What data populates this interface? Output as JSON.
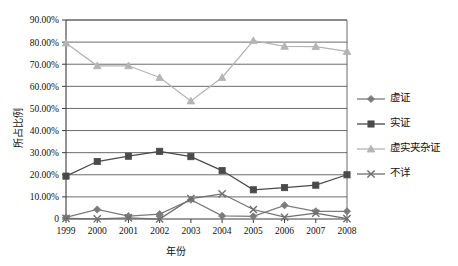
{
  "chart_data": {
    "type": "line",
    "title": "",
    "xlabel": "年份",
    "ylabel": "所占比例",
    "categories": [
      "1999",
      "2000",
      "2001",
      "2002",
      "2003",
      "2004",
      "2005",
      "2006",
      "2007",
      "2008"
    ],
    "x": [
      1999,
      2000,
      2001,
      2002,
      2003,
      2004,
      2005,
      2006,
      2007,
      2008
    ],
    "ylim": [
      0,
      90
    ],
    "yticks": [
      0,
      10,
      20,
      30,
      40,
      50,
      60,
      70,
      80,
      90
    ],
    "ytick_labels": [
      "0",
      "10.00%",
      "20.00%",
      "30.00%",
      "40.00%",
      "50.00%",
      "60.00%",
      "70.00%",
      "80.00%",
      "90.00%"
    ],
    "grid": "horizontal",
    "legend_position": "right",
    "series": [
      {
        "name": "虚证",
        "marker": "diamond",
        "color": "#7b7b7b",
        "values": [
          0.7,
          4.3,
          1.3,
          2.2,
          8.7,
          1.4,
          1.2,
          6.2,
          3.5,
          3.5
        ]
      },
      {
        "name": "实证",
        "marker": "square",
        "color": "#4a4a4a",
        "values": [
          19.4,
          26.0,
          28.4,
          30.6,
          28.2,
          21.9,
          13.2,
          14.2,
          15.3,
          20.0
        ]
      },
      {
        "name": "虚实夹杂证",
        "marker": "triangle",
        "color": "#b4b4b4",
        "values": [
          79.6,
          69.3,
          69.3,
          64.0,
          53.4,
          64.0,
          80.7,
          78.1,
          78.0,
          75.8
        ]
      },
      {
        "name": "不详",
        "marker": "x",
        "color": "#6e6e6e",
        "values": [
          0.3,
          0.1,
          0.5,
          0.0,
          9.2,
          11.4,
          4.3,
          0.8,
          2.6,
          0.2
        ]
      }
    ]
  }
}
